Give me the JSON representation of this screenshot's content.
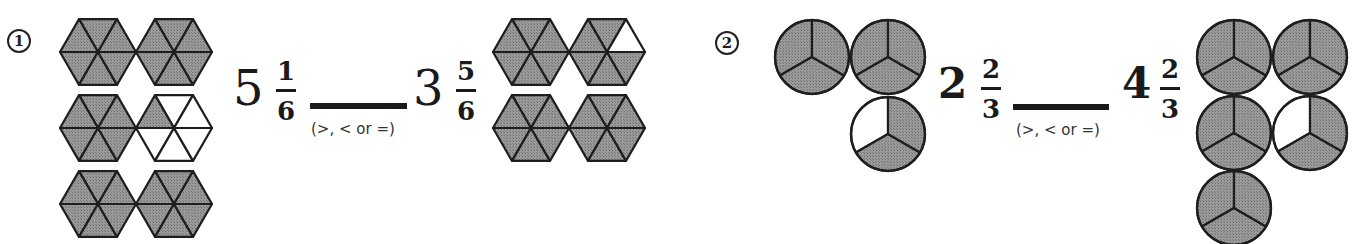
{
  "worksheet": {
    "fill_color": "#8f8f8f",
    "stroke_color": "#1e1e1e",
    "problems": [
      {
        "number": "1",
        "left": {
          "whole": "5",
          "numerator": "1",
          "denominator": "6",
          "model": "hexagon",
          "shapes": [
            {
              "cx": 98,
              "cy": 52,
              "shaded": [
                0,
                1,
                2,
                3,
                4,
                5
              ]
            },
            {
              "cx": 174,
              "cy": 52,
              "shaded": [
                0,
                1,
                2,
                3,
                4,
                5
              ]
            },
            {
              "cx": 98,
              "cy": 128,
              "shaded": [
                0,
                1,
                2,
                3,
                4,
                5
              ]
            },
            {
              "cx": 174,
              "cy": 128,
              "shaded": [
                2
              ]
            },
            {
              "cx": 98,
              "cy": 204,
              "shaded": [
                0,
                1,
                2,
                3,
                4,
                5
              ]
            },
            {
              "cx": 174,
              "cy": 204,
              "shaded": [
                0,
                1,
                2,
                3,
                4,
                5
              ]
            }
          ]
        },
        "blank_hint": "(>, < or =)",
        "right": {
          "whole": "3",
          "numerator": "5",
          "denominator": "6",
          "model": "hexagon",
          "shapes": [
            {
              "cx": 531,
              "cy": 52,
              "shaded": [
                0,
                1,
                2,
                3,
                4,
                5
              ]
            },
            {
              "cx": 607,
              "cy": 52,
              "shaded": [
                0,
                2,
                3,
                4,
                5
              ]
            },
            {
              "cx": 531,
              "cy": 128,
              "shaded": [
                0,
                1,
                2,
                3,
                4,
                5
              ]
            },
            {
              "cx": 607,
              "cy": 128,
              "shaded": [
                0,
                1,
                2,
                3,
                4,
                5
              ]
            }
          ]
        }
      },
      {
        "number": "2",
        "left": {
          "whole": "2",
          "numerator": "2",
          "denominator": "3",
          "model": "circle-thirds",
          "shapes": [
            {
              "cx": 812,
              "cy": 57,
              "shaded": [
                0,
                1,
                2
              ]
            },
            {
              "cx": 888,
              "cy": 57,
              "shaded": [
                0,
                1,
                2
              ]
            },
            {
              "cx": 888,
              "cy": 134,
              "shaded": [
                1,
                2
              ]
            }
          ]
        },
        "blank_hint": "(>, < or =)",
        "right": {
          "whole": "4",
          "numerator": "2",
          "denominator": "3",
          "model": "circle-thirds",
          "shapes": [
            {
              "cx": 1234,
              "cy": 57,
              "shaded": [
                0,
                1,
                2
              ]
            },
            {
              "cx": 1310,
              "cy": 57,
              "shaded": [
                0,
                1,
                2
              ]
            },
            {
              "cx": 1234,
              "cy": 133,
              "shaded": [
                0,
                1,
                2
              ]
            },
            {
              "cx": 1310,
              "cy": 133,
              "shaded": [
                1,
                2
              ]
            },
            {
              "cx": 1234,
              "cy": 208,
              "shaded": [
                0,
                1,
                2
              ]
            }
          ]
        }
      }
    ]
  }
}
